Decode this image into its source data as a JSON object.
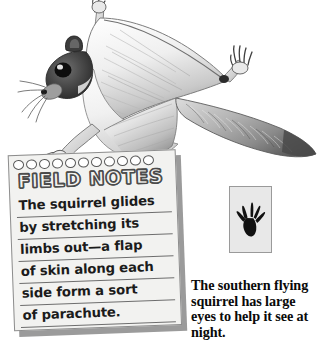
{
  "page": {
    "background_color": "#ffffff",
    "width": 317,
    "height": 350
  },
  "illustration": {
    "name": "flying-squirrel-gliding",
    "description": "Grayscale pencil drawing of a southern flying squirrel gliding with limbs outstretched, patagium skin flaps extended, and a flat feathered tail",
    "style": "pencil-sketch-grayscale"
  },
  "field_notes": {
    "title": "FIELD NOTES",
    "hole_count": 11,
    "paper_color": "#f2f2f0",
    "shadow_color": "#9b9b9b",
    "rule_color": "#6d6d6d",
    "lines": [
      "The squirrel glides",
      "by stretching its",
      "limbs out—a flap",
      "of skin along each",
      "side form a sort",
      "of parachute.",
      ""
    ]
  },
  "track": {
    "label": "squirrel-track-print",
    "box_fill": "#e8e8e8",
    "box_border": "#9a9a9a",
    "print_color": "#111111"
  },
  "caption": {
    "text": "The southern flying squirrel has large eyes to help it see at night.",
    "color": "#0a0a0a"
  }
}
